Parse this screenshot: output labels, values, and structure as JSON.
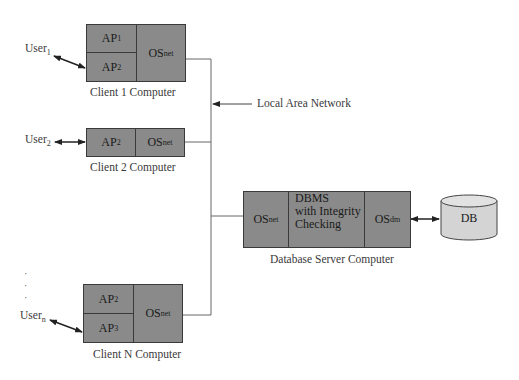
{
  "network": {
    "label": "Local Area Network"
  },
  "clients": [
    {
      "caption": "Client 1 Computer",
      "user": {
        "base": "User",
        "sub": "1"
      },
      "apps": [
        {
          "base": "AP",
          "sub": "1"
        },
        {
          "base": "AP",
          "sub": "2"
        }
      ],
      "os": {
        "base": "OS",
        "sub": "net"
      }
    },
    {
      "caption": "Client 2 Computer",
      "user": {
        "base": "User",
        "sub": "2"
      },
      "apps": [
        {
          "base": "AP",
          "sub": "2"
        }
      ],
      "os": {
        "base": "OS",
        "sub": "net"
      }
    },
    {
      "caption": "Client N Computer",
      "user": {
        "base": "User",
        "sub": "n"
      },
      "apps": [
        {
          "base": "AP",
          "sub": "2"
        },
        {
          "base": "AP",
          "sub": "3"
        }
      ],
      "os": {
        "base": "OS",
        "sub": "net"
      }
    }
  ],
  "server": {
    "caption": "Database Server Computer",
    "os_net": {
      "base": "OS",
      "sub": "net"
    },
    "dbms": {
      "line1": "DBMS",
      "line2": "with Integrity",
      "line3": "Checking"
    },
    "os_dm": {
      "base": "OS",
      "sub": "dm"
    }
  },
  "database": {
    "label": "DB"
  },
  "ellipsis": ".\n.\n.",
  "colors": {
    "box_fill": "#8a8a8a",
    "box_border": "#3a3a3a",
    "db_fill": "#d4d4d4",
    "line": "#555555"
  }
}
